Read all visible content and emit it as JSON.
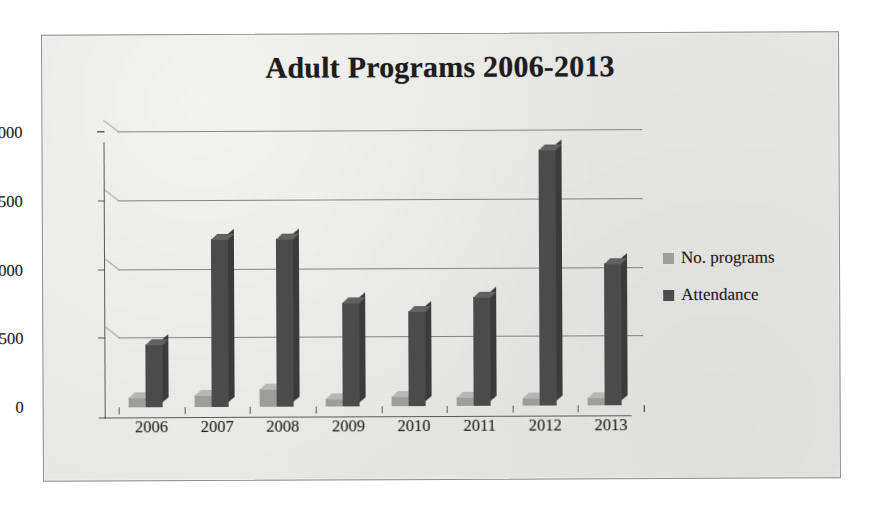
{
  "chart_data": {
    "type": "bar",
    "title": "Adult Programs 2006-2013",
    "xlabel": "",
    "ylabel": "",
    "categories": [
      "2006",
      "2007",
      "2008",
      "2009",
      "2010",
      "2011",
      "2012",
      "2013"
    ],
    "series": [
      {
        "name": "No. programs",
        "color": "#9d9d9b",
        "values": [
          75,
          85,
          130,
          60,
          70,
          65,
          60,
          60
        ]
      },
      {
        "name": "Attendance",
        "color": "#4b4b4b",
        "values": [
          460,
          1225,
          1225,
          760,
          690,
          790,
          1860,
          1030
        ]
      }
    ],
    "ylim": [
      0,
      2000
    ],
    "yticks": [
      0,
      500,
      1000,
      1500,
      2000
    ],
    "ytick_labels": [
      "0",
      "500",
      "1000",
      "1500",
      "2000"
    ],
    "grid": true,
    "legend_position": "right",
    "style": "3d-column"
  },
  "legend": {
    "items": [
      {
        "label": "No. programs",
        "marker": "square-light"
      },
      {
        "label": "Attendance",
        "marker": "square-dark"
      }
    ]
  },
  "colors": {
    "background": "#e9e9e7",
    "border": "#8d8d8d",
    "programs": "#9d9d9b",
    "attendance": "#4b4b4b",
    "grid": "#6f6f6f",
    "text": "#1f1f1f"
  }
}
